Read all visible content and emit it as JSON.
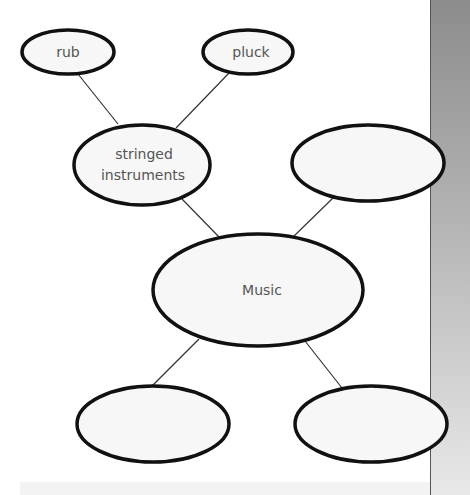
{
  "diagram": {
    "type": "concept-map",
    "center": {
      "id": "music",
      "label": "Music"
    },
    "nodes": [
      {
        "id": "rub",
        "label": "rub",
        "cx": 68,
        "cy": 52,
        "rx": 46,
        "ry": 22
      },
      {
        "id": "pluck",
        "label": "pluck",
        "cx": 248,
        "cy": 52,
        "rx": 45,
        "ry": 22
      },
      {
        "id": "stringed",
        "label_line1": "stringed",
        "label_line2": "instruments",
        "cx": 142,
        "cy": 165,
        "rx": 68,
        "ry": 40
      },
      {
        "id": "top-right",
        "label": "",
        "cx": 368,
        "cy": 163,
        "rx": 76,
        "ry": 38
      },
      {
        "id": "music",
        "label": "Music",
        "cx": 258,
        "cy": 290,
        "rx": 105,
        "ry": 56
      },
      {
        "id": "bottom-left",
        "label": "",
        "cx": 153,
        "cy": 424,
        "rx": 76,
        "ry": 38
      },
      {
        "id": "bottom-right",
        "label": "",
        "cx": 371,
        "cy": 424,
        "rx": 76,
        "ry": 38
      }
    ],
    "edges": [
      {
        "from": "rub",
        "to": "stringed"
      },
      {
        "from": "pluck",
        "to": "stringed"
      },
      {
        "from": "stringed",
        "to": "music"
      },
      {
        "from": "top-right",
        "to": "music"
      },
      {
        "from": "music",
        "to": "bottom-left"
      },
      {
        "from": "music",
        "to": "bottom-right"
      }
    ]
  },
  "colors": {
    "node_fill": "#f7f7f7",
    "node_stroke": "#111111",
    "edge": "#333333",
    "text": "#555555"
  }
}
